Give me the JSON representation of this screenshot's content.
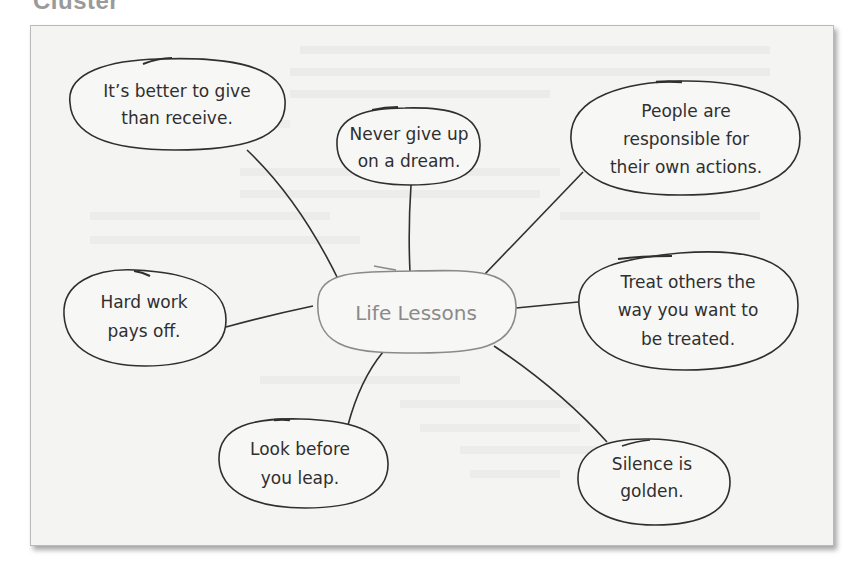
{
  "heading": "Cluster",
  "diagram": {
    "type": "cluster map",
    "center": {
      "label": "Life Lessons"
    },
    "nodes": [
      {
        "id": "give",
        "lines": [
          "It’s better to give",
          "than receive."
        ]
      },
      {
        "id": "dream",
        "lines": [
          "Never give up",
          "on a dream."
        ]
      },
      {
        "id": "responsible",
        "lines": [
          "People are",
          "responsible for",
          "their own actions."
        ]
      },
      {
        "id": "treat",
        "lines": [
          "Treat others the",
          "way you want to",
          "be treated."
        ]
      },
      {
        "id": "hardwork",
        "lines": [
          "Hard work",
          "pays off."
        ]
      },
      {
        "id": "look",
        "lines": [
          "Look before",
          "you leap."
        ]
      },
      {
        "id": "silence",
        "lines": [
          "Silence is",
          "golden."
        ]
      }
    ]
  },
  "colors": {
    "frame_bg": "#f4f4f3",
    "stroke": "#2f2f2f",
    "center_stroke": "#8a8a8a",
    "heading": "#9a9a9a"
  }
}
